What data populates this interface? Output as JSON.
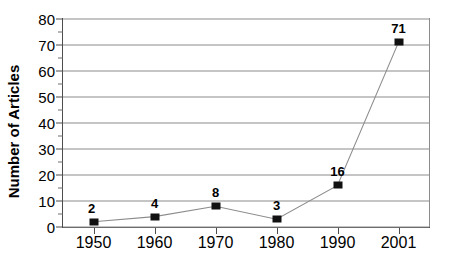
{
  "chart_data": {
    "type": "line",
    "title": "",
    "xlabel": "",
    "ylabel": "Number of Articles",
    "categories": [
      "1950",
      "1960",
      "1970",
      "1980",
      "1990",
      "2001"
    ],
    "values": [
      2,
      4,
      8,
      3,
      16,
      71
    ],
    "point_labels": [
      "2",
      "4",
      "8",
      "3",
      "16",
      "71"
    ],
    "ylim": [
      0,
      80
    ],
    "y_ticks": [
      0,
      10,
      20,
      30,
      40,
      50,
      60,
      70,
      80
    ],
    "y_tick_labels": [
      "0",
      "10",
      "20",
      "30",
      "40",
      "50",
      "60",
      "70",
      "80"
    ],
    "y_minor_ticks": [
      5,
      15,
      25,
      35,
      45,
      55,
      65,
      75
    ],
    "grid": true,
    "legend": "none",
    "series": [
      {
        "name": "Number of Articles",
        "values": [
          2,
          4,
          8,
          3,
          16,
          71
        ],
        "marker": "square",
        "marker_color": "#111111",
        "line_color": "#8c8c8c"
      }
    ],
    "colors": {
      "line": "#8c8c8c",
      "marker": "#111111",
      "grid": "#8c8c8c",
      "axis": "#4d4d4d",
      "text": "#000000",
      "background": "#ffffff"
    }
  }
}
